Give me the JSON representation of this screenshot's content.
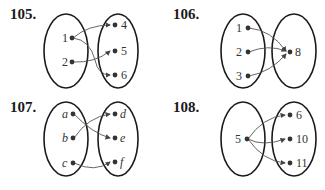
{
  "problems": [
    {
      "number": "105.",
      "domain": [
        "1",
        "2"
      ],
      "range": [
        "4",
        "5",
        "6"
      ],
      "arrows": [
        [
          "1",
          "4"
        ],
        [
          "1",
          "6"
        ],
        [
          "2",
          "5"
        ]
      ],
      "italic": false
    },
    {
      "number": "106.",
      "domain": [
        "1",
        "2",
        "3"
      ],
      "range": [
        "8"
      ],
      "arrows": [
        [
          "1",
          "8"
        ],
        [
          "2",
          "8"
        ],
        [
          "3",
          "8"
        ]
      ],
      "italic": false
    },
    {
      "number": "107.",
      "domain": [
        "a",
        "b",
        "c"
      ],
      "range": [
        "d",
        "e",
        "f"
      ],
      "arrows": [
        [
          "a",
          "e"
        ],
        [
          "b",
          "d"
        ],
        [
          "c",
          "f"
        ]
      ],
      "italic": true
    },
    {
      "number": "108.",
      "domain": [
        "5"
      ],
      "range": [
        "6",
        "10",
        "11"
      ],
      "arrows": [
        [
          "5",
          "6"
        ],
        [
          "5",
          "10"
        ],
        [
          "5",
          "11"
        ]
      ],
      "italic": false
    }
  ],
  "colors": {
    "ellipse": "#1a1a1a",
    "arrow": "#555555",
    "dot": "#333333"
  }
}
